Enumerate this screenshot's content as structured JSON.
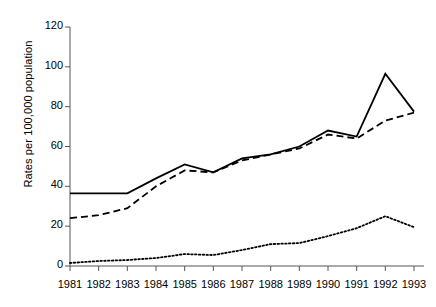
{
  "chart_data": {
    "type": "line",
    "title": "",
    "xlabel": "",
    "ylabel": "Rates per 100,000 population",
    "x": [
      1981,
      1982,
      1983,
      1984,
      1985,
      1986,
      1987,
      1988,
      1989,
      1990,
      1991,
      1992,
      1993
    ],
    "categories": [
      "1981",
      "1982",
      "1983",
      "1984",
      "1985",
      "1986",
      "1987",
      "1988",
      "1989",
      "1990",
      "1991",
      "1992",
      "1993"
    ],
    "xlim": [
      1981,
      1993
    ],
    "ylim": [
      0,
      120
    ],
    "yticks": [
      0,
      20,
      40,
      60,
      80,
      100,
      120
    ],
    "ytick_labels": [
      "0",
      "20",
      "40",
      "60",
      "80",
      "100",
      "120"
    ],
    "grid": false,
    "legend": "none",
    "series": [
      {
        "name": "solid-series",
        "style": "solid",
        "color": "#000000",
        "values": [
          36.5,
          36.5,
          36.5,
          44,
          51,
          47,
          54,
          56,
          60,
          68,
          65,
          96.5,
          77.5
        ]
      },
      {
        "name": "dashed-series",
        "style": "dashed",
        "color": "#000000",
        "values": [
          24,
          25.5,
          29,
          40,
          48,
          47,
          53,
          56,
          59,
          66,
          64,
          73,
          77
        ]
      },
      {
        "name": "dotted-series",
        "style": "dotted",
        "color": "#000000",
        "values": [
          1.5,
          2.5,
          3,
          4,
          6,
          5.5,
          8,
          11,
          11.5,
          15,
          19,
          25,
          19.5
        ]
      }
    ]
  }
}
